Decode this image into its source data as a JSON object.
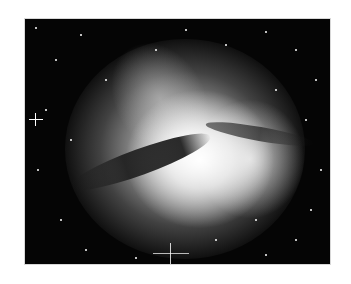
{
  "image": {
    "subject": "galaxy-photograph",
    "description": "Grayscale astronomical image of a galaxy with a dark dust lane across a bright central bulge, surrounded by stars",
    "background_color": "#ffffff",
    "frame": {
      "x": 24,
      "y": 18,
      "width": 307,
      "height": 247
    }
  }
}
